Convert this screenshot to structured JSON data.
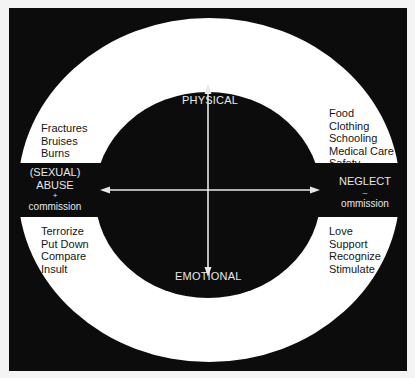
{
  "diagram": {
    "axes": {
      "top": "PHYSICAL",
      "bottom": "EMOTIONAL"
    },
    "left": {
      "title_line1": "(SEXUAL)",
      "title_line2": "ABUSE",
      "sign": "+",
      "subtitle": "commission",
      "physical_items": [
        "Fractures",
        "Bruises",
        "Burns"
      ],
      "emotional_items": [
        "Terrorize",
        "Put Down",
        "Compare",
        "Insult"
      ]
    },
    "right": {
      "title": "NEGLECT",
      "sign": "–",
      "subtitle": "ommission",
      "physical_items": [
        "Food",
        "Clothing",
        "Schooling",
        "Medical Care",
        "Safety"
      ],
      "emotional_items": [
        "Love",
        "Support",
        "Recognize",
        "Stimulate"
      ]
    },
    "colors": {
      "background": "#0c0c0c",
      "ring": "#ffffff",
      "text_light": "#e6e6e6",
      "text_dark": "#151515"
    }
  }
}
